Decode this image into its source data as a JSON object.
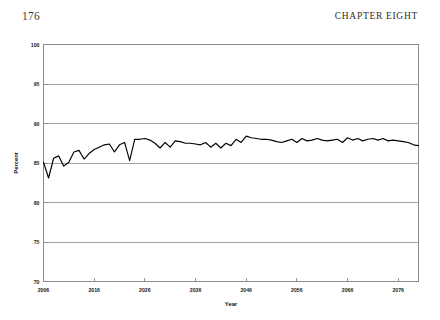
{
  "page": {
    "folio": "176",
    "running_head": "CHAPTER EIGHT"
  },
  "chart_data": {
    "type": "line",
    "title": "",
    "xlabel": "Year",
    "ylabel": "Percent",
    "xlim": [
      2006,
      2080
    ],
    "ylim": [
      70,
      100
    ],
    "grid": true,
    "legend": false,
    "legend_position": "none",
    "line_color": "#000000",
    "grid_color": "#8a8a8a",
    "yticks": [
      70,
      75,
      80,
      85,
      90,
      95,
      100
    ],
    "ytick_labels": [
      "70",
      "75",
      "80",
      "85",
      "90",
      "95",
      "100"
    ],
    "xticks": [
      2006,
      2016,
      2026,
      2036,
      2046,
      2056,
      2066,
      2076
    ],
    "xtick_labels": [
      "2006",
      "2016",
      "2026",
      "2036",
      "2046",
      "2056",
      "2066",
      "2076"
    ],
    "x": [
      2006,
      2007,
      2008,
      2009,
      2010,
      2011,
      2012,
      2013,
      2014,
      2015,
      2016,
      2017,
      2018,
      2019,
      2020,
      2021,
      2022,
      2023,
      2024,
      2025,
      2026,
      2027,
      2028,
      2029,
      2030,
      2031,
      2032,
      2033,
      2034,
      2035,
      2036,
      2037,
      2038,
      2039,
      2040,
      2041,
      2042,
      2043,
      2044,
      2045,
      2046,
      2047,
      2048,
      2049,
      2050,
      2051,
      2052,
      2053,
      2054,
      2055,
      2056,
      2057,
      2058,
      2059,
      2060,
      2061,
      2062,
      2063,
      2064,
      2065,
      2066,
      2067,
      2068,
      2069,
      2070,
      2071,
      2072,
      2073,
      2074,
      2075,
      2076,
      2077,
      2078,
      2079,
      2080
    ],
    "series": [
      {
        "name": "Percent",
        "values": [
          85.1,
          83.1,
          85.6,
          85.9,
          84.6,
          85.1,
          86.4,
          86.6,
          85.5,
          86.2,
          86.7,
          87.0,
          87.3,
          87.4,
          86.4,
          87.3,
          87.6,
          85.3,
          88.0,
          88.0,
          88.1,
          87.9,
          87.5,
          86.9,
          87.6,
          87.0,
          87.8,
          87.7,
          87.5,
          87.5,
          87.4,
          87.3,
          87.6,
          87.0,
          87.5,
          86.9,
          87.5,
          87.2,
          88.0,
          87.6,
          88.4,
          88.2,
          88.1,
          88.0,
          88.0,
          87.9,
          87.7,
          87.6,
          87.8,
          88.0,
          87.6,
          88.1,
          87.8,
          87.9,
          88.1,
          87.9,
          87.8,
          87.9,
          88.0,
          87.6,
          88.2,
          87.9,
          88.1,
          87.8,
          88.0,
          88.1,
          87.9,
          88.1,
          87.8,
          87.9,
          87.8,
          87.7,
          87.6,
          87.3,
          87.2
        ]
      }
    ]
  }
}
